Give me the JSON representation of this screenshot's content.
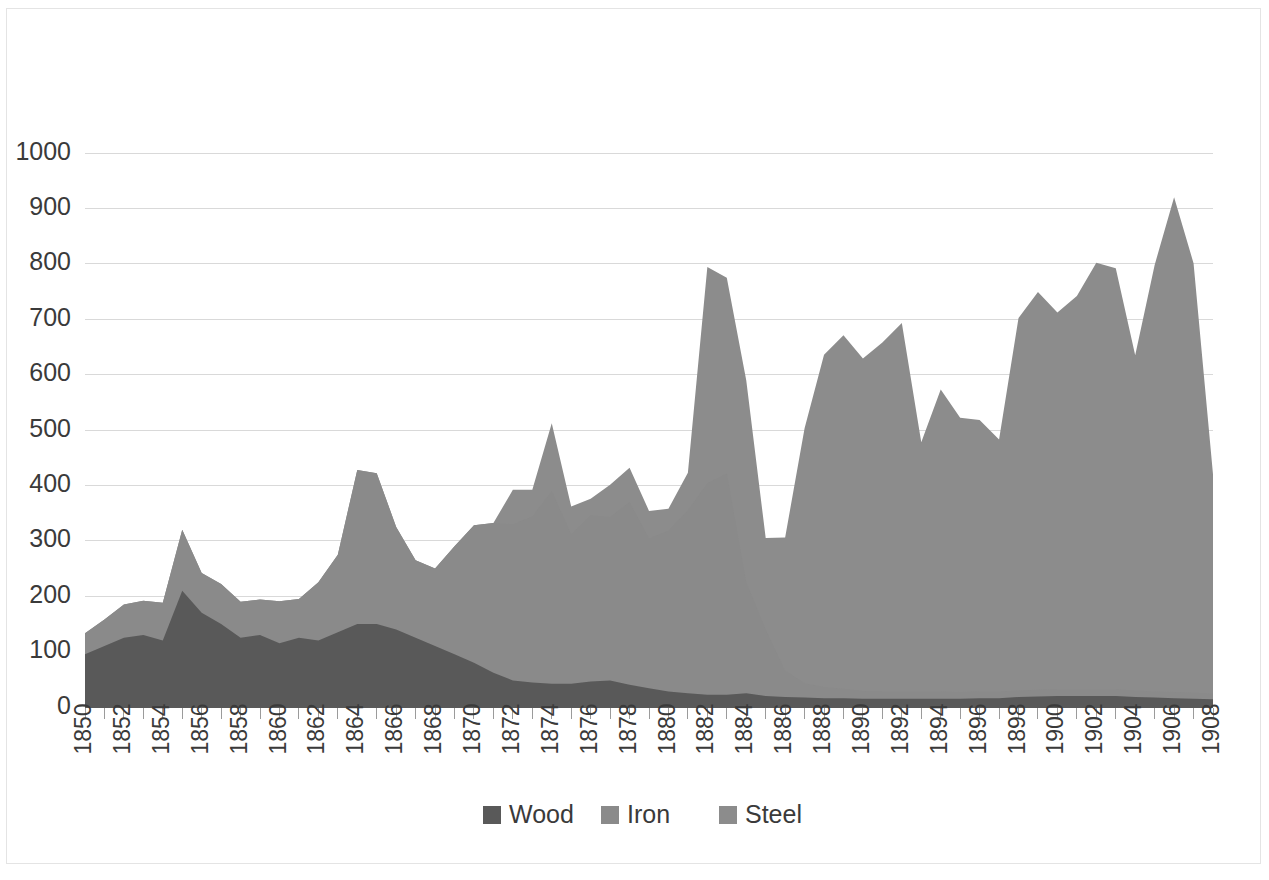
{
  "chart_data": {
    "type": "area",
    "stacked": true,
    "title": "",
    "subtitle": "",
    "xlabel": "",
    "ylabel": "",
    "xlim": [
      1850,
      1908
    ],
    "ylim": [
      0,
      1000
    ],
    "grid": true,
    "legend_position": "bottom",
    "y_ticks": [
      0,
      100,
      200,
      300,
      400,
      500,
      600,
      700,
      800,
      900,
      1000
    ],
    "y_tick_labels": [
      "0",
      "100",
      "200",
      "300",
      "400",
      "500",
      "600",
      "700",
      "800",
      "900",
      "1000"
    ],
    "x_tick_labels": [
      "1850",
      "1852",
      "1854",
      "1856",
      "1858",
      "1860",
      "1862",
      "1864",
      "1866",
      "1868",
      "1870",
      "1872",
      "1874",
      "1876",
      "1878",
      "1880",
      "1882",
      "1884",
      "1886",
      "1888",
      "1890",
      "1892",
      "1894",
      "1896",
      "1898",
      "1900",
      "1902",
      "1904",
      "1906",
      "1908"
    ],
    "x": [
      1850,
      1851,
      1852,
      1853,
      1854,
      1855,
      1856,
      1857,
      1858,
      1859,
      1860,
      1861,
      1862,
      1863,
      1864,
      1865,
      1866,
      1867,
      1868,
      1869,
      1870,
      1871,
      1872,
      1873,
      1874,
      1875,
      1876,
      1877,
      1878,
      1879,
      1880,
      1881,
      1882,
      1883,
      1884,
      1885,
      1886,
      1887,
      1888,
      1889,
      1890,
      1891,
      1892,
      1893,
      1894,
      1895,
      1896,
      1897,
      1898,
      1899,
      1900,
      1901,
      1902,
      1903,
      1904,
      1905,
      1906,
      1907,
      1908
    ],
    "series": [
      {
        "name": "Wood",
        "color": "#595959",
        "values": [
          95,
          110,
          125,
          130,
          120,
          210,
          170,
          150,
          125,
          130,
          115,
          125,
          120,
          135,
          150,
          150,
          140,
          125,
          110,
          95,
          80,
          62,
          48,
          44,
          42,
          42,
          46,
          48,
          40,
          34,
          28,
          25,
          22,
          22,
          25,
          20,
          18,
          17,
          16,
          16,
          15,
          15,
          15,
          15,
          15,
          15,
          16,
          16,
          18,
          19,
          20,
          20,
          20,
          20,
          18,
          17,
          16,
          15,
          14
        ]
      },
      {
        "name": "Iron",
        "color": "#8a8a8a",
        "values": [
          38,
          48,
          60,
          62,
          68,
          110,
          72,
          72,
          65,
          64,
          76,
          70,
          105,
          140,
          278,
          272,
          185,
          140,
          140,
          195,
          248,
          270,
          282,
          300,
          348,
          270,
          300,
          295,
          330,
          270,
          290,
          330,
          382,
          400,
          200,
          120,
          48,
          26,
          20,
          17,
          14,
          13,
          13,
          13,
          13,
          12,
          12,
          12,
          12,
          12,
          12,
          12,
          12,
          12,
          12,
          11,
          11,
          11,
          10
        ]
      },
      {
        "name": "Steel",
        "color": "#8c8c8c",
        "values": [
          0,
          0,
          0,
          0,
          0,
          0,
          0,
          0,
          0,
          0,
          0,
          0,
          0,
          0,
          0,
          0,
          0,
          0,
          0,
          0,
          0,
          0,
          62,
          48,
          122,
          50,
          30,
          58,
          62,
          50,
          40,
          68,
          390,
          353,
          365,
          165,
          240,
          460,
          600,
          638,
          600,
          630,
          665,
          450,
          545,
          495,
          490,
          455,
          672,
          718,
          680,
          710,
          770,
          760,
          605,
          770,
          893,
          775,
          396
        ]
      }
    ],
    "totals": [
      133,
      158,
      185,
      192,
      188,
      320,
      242,
      222,
      190,
      194,
      191,
      195,
      225,
      275,
      428,
      422,
      325,
      265,
      250,
      290,
      328,
      332,
      392,
      392,
      518,
      362,
      376,
      401,
      432,
      354,
      358,
      423,
      794,
      775,
      590,
      305,
      306,
      503,
      636,
      671,
      629,
      658,
      693,
      478,
      573,
      522,
      518,
      483,
      702,
      749,
      712,
      742,
      802,
      792,
      635,
      798,
      920,
      801,
      420
    ]
  },
  "legend": {
    "items": [
      {
        "label": "Wood",
        "color": "#595959"
      },
      {
        "label": "Iron",
        "color": "#8a8a8a"
      },
      {
        "label": "Steel",
        "color": "#8c8c8c"
      }
    ]
  },
  "colors": {
    "background": "#ffffff",
    "gridline": "#d9d9d9",
    "axis": "#595959",
    "text": "#3a3a3a",
    "border": "#e4e4e4"
  }
}
